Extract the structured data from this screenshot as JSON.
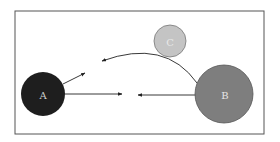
{
  "diagram": {
    "nodes": [
      {
        "id": "A",
        "label": "A",
        "cx": 43,
        "cy": 94,
        "r": 22,
        "fill": "#1e1e1e",
        "text_color": "#cfcfcf"
      },
      {
        "id": "B",
        "label": "B",
        "cx": 224,
        "cy": 94,
        "r": 29,
        "fill": "#7e7e7e",
        "text_color": "#e6e6e6"
      },
      {
        "id": "C",
        "label": "C",
        "cx": 170,
        "cy": 41,
        "r": 16,
        "fill": "#c4c4c4",
        "text_color": "#e8e8e8"
      }
    ],
    "edges": [
      {
        "from": "A",
        "to": "right",
        "kind": "straight-arrow"
      },
      {
        "from": "A",
        "to": "upper-right",
        "kind": "straight-arrow"
      },
      {
        "from": "B",
        "to": "left",
        "kind": "straight-arrow"
      },
      {
        "from": "B",
        "to": "upper-left",
        "kind": "curved-arrow"
      }
    ],
    "frame_color": "#555555"
  }
}
